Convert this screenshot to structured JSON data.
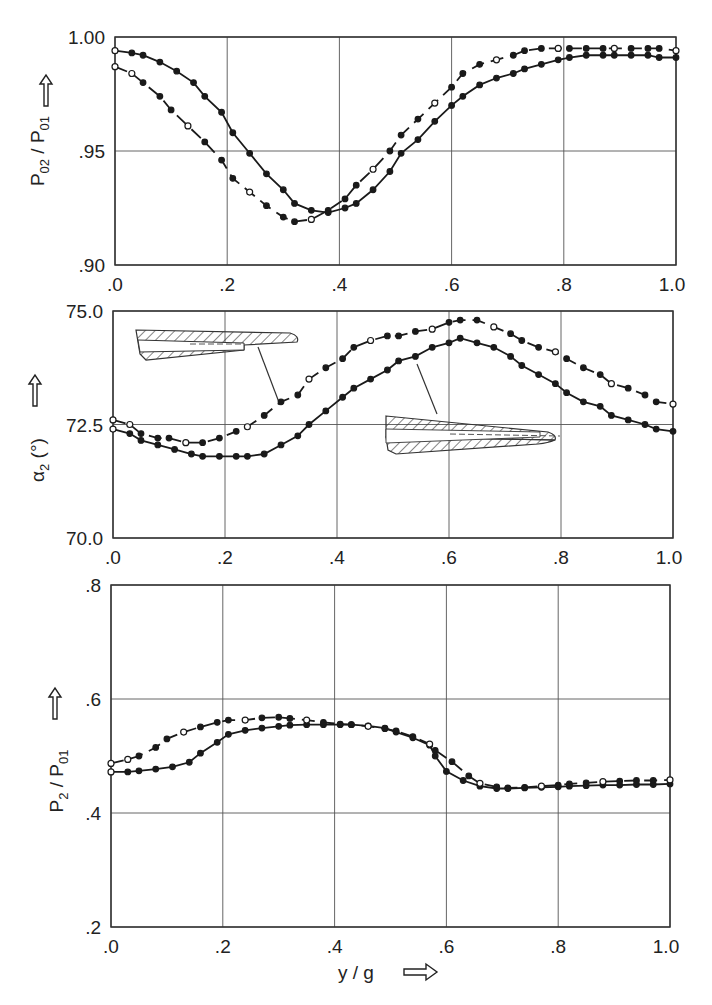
{
  "chart_data": [
    {
      "type": "line",
      "panel": "top",
      "ylabel": "P02 / P01",
      "ylabel_parts": {
        "main": "P",
        "sub1": "02",
        "sep": " / ",
        "main2": "P",
        "sub2": "01"
      },
      "xlim": [
        0,
        1.0
      ],
      "ylim": [
        0.9,
        1.0
      ],
      "xticks": [
        ".0",
        ".2",
        ".4",
        ".6",
        ".8",
        "1.0"
      ],
      "yticks": [
        ".90",
        ".95",
        "1.00"
      ],
      "grid": true,
      "series": [
        {
          "name": "solid",
          "style": "solid",
          "x": [
            0.0,
            0.03,
            0.05,
            0.08,
            0.11,
            0.14,
            0.16,
            0.19,
            0.21,
            0.24,
            0.27,
            0.3,
            0.32,
            0.35,
            0.38,
            0.41,
            0.43,
            0.46,
            0.49,
            0.51,
            0.54,
            0.57,
            0.6,
            0.62,
            0.65,
            0.68,
            0.71,
            0.73,
            0.76,
            0.79,
            0.81,
            0.84,
            0.87,
            0.89,
            0.92,
            0.95,
            0.97,
            1.0
          ],
          "y": [
            0.994,
            0.993,
            0.992,
            0.989,
            0.985,
            0.98,
            0.974,
            0.967,
            0.958,
            0.949,
            0.94,
            0.933,
            0.927,
            0.924,
            0.923,
            0.925,
            0.927,
            0.933,
            0.941,
            0.949,
            0.955,
            0.963,
            0.97,
            0.974,
            0.979,
            0.982,
            0.984,
            0.986,
            0.988,
            0.99,
            0.991,
            0.992,
            0.992,
            0.992,
            0.992,
            0.992,
            0.991,
            0.991
          ]
        },
        {
          "name": "dashed",
          "style": "dashed",
          "x": [
            0.0,
            0.03,
            0.05,
            0.08,
            0.1,
            0.13,
            0.16,
            0.19,
            0.21,
            0.24,
            0.27,
            0.3,
            0.32,
            0.35,
            0.38,
            0.41,
            0.43,
            0.46,
            0.49,
            0.51,
            0.54,
            0.57,
            0.6,
            0.62,
            0.65,
            0.68,
            0.71,
            0.73,
            0.76,
            0.79,
            0.81,
            0.84,
            0.87,
            0.89,
            0.92,
            0.95,
            0.97,
            1.0
          ],
          "y": [
            0.987,
            0.984,
            0.98,
            0.974,
            0.968,
            0.961,
            0.954,
            0.946,
            0.938,
            0.932,
            0.926,
            0.921,
            0.919,
            0.92,
            0.924,
            0.929,
            0.935,
            0.942,
            0.95,
            0.957,
            0.964,
            0.971,
            0.978,
            0.984,
            0.988,
            0.99,
            0.992,
            0.994,
            0.995,
            0.995,
            0.995,
            0.995,
            0.995,
            0.995,
            0.995,
            0.995,
            0.995,
            0.994
          ]
        }
      ]
    },
    {
      "type": "line",
      "panel": "middle",
      "ylabel": "α2 (°)",
      "ylabel_parts": {
        "main": "α",
        "sub": "2",
        "unit": " (°)"
      },
      "xlim": [
        0,
        1.0
      ],
      "ylim": [
        70.0,
        75.0
      ],
      "xticks": [
        ".0",
        ".2",
        ".4",
        ".6",
        ".8",
        "1.0"
      ],
      "yticks": [
        "70.0",
        "72.5",
        "75.0"
      ],
      "grid": true,
      "annotations": [
        "blade trailing edge sketch (upper, points to dashed curve)",
        "blade trailing edge sketch (lower, points to solid curve)"
      ],
      "series": [
        {
          "name": "solid",
          "style": "solid",
          "x": [
            0.0,
            0.03,
            0.05,
            0.08,
            0.11,
            0.14,
            0.16,
            0.19,
            0.22,
            0.24,
            0.27,
            0.3,
            0.33,
            0.35,
            0.38,
            0.41,
            0.43,
            0.46,
            0.49,
            0.51,
            0.54,
            0.57,
            0.6,
            0.62,
            0.65,
            0.68,
            0.71,
            0.73,
            0.76,
            0.79,
            0.81,
            0.84,
            0.87,
            0.89,
            0.92,
            0.95,
            0.97,
            1.0
          ],
          "y": [
            72.4,
            72.3,
            72.15,
            72.05,
            71.95,
            71.85,
            71.8,
            71.8,
            71.8,
            71.8,
            71.85,
            72.05,
            72.25,
            72.5,
            72.8,
            73.1,
            73.3,
            73.5,
            73.7,
            73.9,
            74.0,
            74.2,
            74.3,
            74.4,
            74.3,
            74.2,
            74.0,
            73.8,
            73.6,
            73.4,
            73.2,
            73.0,
            72.9,
            72.7,
            72.6,
            72.5,
            72.4,
            72.35
          ]
        },
        {
          "name": "dashed",
          "style": "dashed",
          "x": [
            0.0,
            0.03,
            0.05,
            0.08,
            0.1,
            0.13,
            0.16,
            0.19,
            0.22,
            0.24,
            0.27,
            0.3,
            0.33,
            0.35,
            0.38,
            0.41,
            0.43,
            0.46,
            0.49,
            0.51,
            0.54,
            0.57,
            0.6,
            0.62,
            0.65,
            0.68,
            0.71,
            0.73,
            0.76,
            0.79,
            0.81,
            0.84,
            0.87,
            0.89,
            0.92,
            0.95,
            0.97,
            1.0
          ],
          "y": [
            72.6,
            72.5,
            72.3,
            72.2,
            72.2,
            72.1,
            72.1,
            72.2,
            72.35,
            72.45,
            72.7,
            73.0,
            73.15,
            73.5,
            73.75,
            73.95,
            74.2,
            74.35,
            74.45,
            74.45,
            74.55,
            74.6,
            74.75,
            74.8,
            74.8,
            74.65,
            74.5,
            74.35,
            74.2,
            74.1,
            73.95,
            73.75,
            73.6,
            73.4,
            73.3,
            73.15,
            73.0,
            72.95
          ]
        }
      ]
    },
    {
      "type": "line",
      "panel": "bottom",
      "ylabel": "P2 / P01",
      "ylabel_parts": {
        "main": "P",
        "sub1": "2",
        "sep": " / ",
        "main2": "P",
        "sub2": "01"
      },
      "xlabel": "y / g",
      "xlim": [
        0,
        1.0
      ],
      "ylim": [
        0.2,
        0.8
      ],
      "xticks": [
        ".0",
        ".2",
        ".4",
        ".6",
        ".8",
        "1.0"
      ],
      "yticks": [
        ".2",
        ".4",
        ".6",
        ".8"
      ],
      "grid": true,
      "series": [
        {
          "name": "solid",
          "style": "solid",
          "x": [
            0.0,
            0.03,
            0.05,
            0.08,
            0.11,
            0.14,
            0.16,
            0.19,
            0.21,
            0.24,
            0.27,
            0.3,
            0.32,
            0.35,
            0.38,
            0.41,
            0.43,
            0.46,
            0.49,
            0.51,
            0.54,
            0.57,
            0.58,
            0.6,
            0.63,
            0.66,
            0.69,
            0.71,
            0.74,
            0.77,
            0.8,
            0.82,
            0.85,
            0.88,
            0.91,
            0.94,
            0.97,
            1.0
          ],
          "y": [
            0.472,
            0.472,
            0.474,
            0.477,
            0.481,
            0.489,
            0.505,
            0.524,
            0.538,
            0.545,
            0.549,
            0.552,
            0.554,
            0.555,
            0.555,
            0.555,
            0.555,
            0.553,
            0.549,
            0.542,
            0.532,
            0.519,
            0.5,
            0.473,
            0.457,
            0.447,
            0.443,
            0.443,
            0.444,
            0.445,
            0.446,
            0.447,
            0.448,
            0.449,
            0.449,
            0.45,
            0.45,
            0.451
          ]
        },
        {
          "name": "dashed",
          "style": "dashed",
          "x": [
            0.0,
            0.03,
            0.05,
            0.08,
            0.1,
            0.13,
            0.16,
            0.19,
            0.21,
            0.24,
            0.27,
            0.3,
            0.32,
            0.35,
            0.38,
            0.41,
            0.43,
            0.46,
            0.49,
            0.51,
            0.54,
            0.57,
            0.58,
            0.61,
            0.64,
            0.66,
            0.69,
            0.71,
            0.74,
            0.77,
            0.8,
            0.82,
            0.85,
            0.88,
            0.91,
            0.94,
            0.97,
            1.0
          ],
          "y": [
            0.487,
            0.494,
            0.5,
            0.515,
            0.53,
            0.542,
            0.551,
            0.559,
            0.563,
            0.563,
            0.567,
            0.568,
            0.566,
            0.563,
            0.559,
            0.556,
            0.555,
            0.552,
            0.548,
            0.544,
            0.534,
            0.521,
            0.51,
            0.49,
            0.465,
            0.452,
            0.446,
            0.444,
            0.445,
            0.447,
            0.449,
            0.451,
            0.453,
            0.455,
            0.456,
            0.457,
            0.457,
            0.458
          ]
        }
      ]
    }
  ],
  "panels": {
    "top": {
      "ytick_labels": [
        "1.00",
        ".95",
        ".90"
      ],
      "xtick_labels": [
        ".0",
        ".2",
        ".4",
        ".6",
        ".8",
        "1.0"
      ]
    },
    "middle": {
      "ytick_labels": [
        "75.0",
        "72.5",
        "70.0"
      ],
      "xtick_labels": [
        ".0",
        ".2",
        ".4",
        ".6",
        ".8",
        "1.0"
      ]
    },
    "bottom": {
      "ytick_labels": [
        ".8",
        ".6",
        ".4",
        ".2"
      ],
      "xtick_labels": [
        ".0",
        ".2",
        ".4",
        ".6",
        ".8",
        "1.0"
      ],
      "xlabel": "y / g"
    }
  },
  "colors": {
    "ink": "#1a1a1a",
    "grid": "#555555",
    "background": "#ffffff"
  }
}
